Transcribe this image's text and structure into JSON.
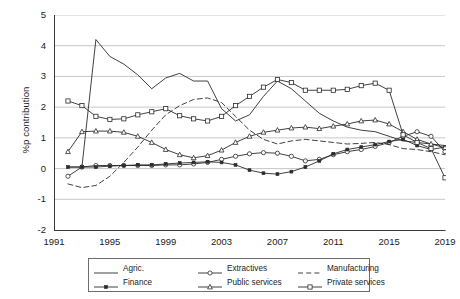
{
  "axes": {
    "ylabel": "%p contribution",
    "yticks": [
      "5",
      "4",
      "3",
      "2",
      "1",
      "0",
      "-1",
      "-2"
    ],
    "ytickvals": [
      5,
      4,
      3,
      2,
      1,
      0,
      -1,
      -2
    ],
    "xticks": [
      "1991",
      "1995",
      "1999",
      "2003",
      "2007",
      "2011",
      "2015",
      "2019"
    ],
    "xtickvals": [
      1991,
      1995,
      1999,
      2003,
      2007,
      2011,
      2015,
      2019
    ]
  },
  "legend": {
    "items": [
      {
        "label": "Agric.",
        "key": "line",
        "marker": "none"
      },
      {
        "label": "Extractives",
        "key": "line-marker",
        "marker": "circle"
      },
      {
        "label": "Manufacturing",
        "key": "dashed",
        "marker": "none"
      },
      {
        "label": "Finance",
        "key": "line-marker",
        "marker": "dot"
      },
      {
        "label": "Public services",
        "key": "line-marker",
        "marker": "triangle"
      },
      {
        "label": "Private services",
        "key": "line-marker",
        "marker": "square"
      }
    ]
  },
  "chart_data": {
    "type": "line",
    "title": "",
    "xlabel": "",
    "ylabel": "%p contribution",
    "xlim": [
      1991,
      2019
    ],
    "ylim": [
      -2,
      5
    ],
    "grid": "horizontal",
    "legend_position": "below",
    "x": [
      1992,
      1993,
      1994,
      1995,
      1996,
      1997,
      1998,
      1999,
      2000,
      2001,
      2002,
      2003,
      2004,
      2005,
      2006,
      2007,
      2008,
      2009,
      2010,
      2011,
      2012,
      2013,
      2014,
      2015,
      2016,
      2017,
      2018,
      2019
    ],
    "series": [
      {
        "name": "Agric.",
        "marker": "none",
        "dash": "solid",
        "values": [
          0.05,
          0.05,
          4.2,
          3.65,
          3.4,
          3.05,
          2.6,
          2.95,
          3.1,
          2.85,
          2.85,
          1.95,
          1.55,
          1.75,
          2.35,
          2.85,
          2.6,
          2.2,
          1.8,
          1.55,
          1.35,
          1.25,
          1.2,
          1.05,
          0.9,
          0.85,
          0.8,
          0.75
        ]
      },
      {
        "name": "Extractives",
        "marker": "circle",
        "dash": "solid",
        "values": [
          -0.25,
          0.05,
          0.1,
          0.1,
          0.1,
          0.1,
          0.1,
          0.12,
          0.12,
          0.15,
          0.2,
          0.3,
          0.4,
          0.48,
          0.52,
          0.5,
          0.4,
          0.25,
          0.3,
          0.45,
          0.55,
          0.62,
          0.72,
          0.85,
          1.05,
          1.2,
          1.05,
          0.55
        ]
      },
      {
        "name": "Manufacturing",
        "marker": "none",
        "dash": "dashed",
        "values": [
          -0.5,
          -0.62,
          -0.55,
          -0.25,
          0.2,
          0.7,
          1.25,
          1.75,
          2.05,
          2.25,
          2.3,
          2.15,
          1.7,
          1.25,
          0.95,
          0.8,
          0.9,
          0.95,
          0.9,
          0.85,
          0.8,
          0.82,
          0.85,
          0.78,
          0.65,
          0.62,
          0.55,
          0.45
        ]
      },
      {
        "name": "Finance",
        "marker": "dot",
        "dash": "solid",
        "values": [
          0.05,
          0.05,
          0.05,
          0.08,
          0.1,
          0.12,
          0.12,
          0.15,
          0.18,
          0.2,
          0.22,
          0.2,
          0.12,
          -0.05,
          -0.15,
          -0.18,
          -0.1,
          0.05,
          0.25,
          0.48,
          0.62,
          0.7,
          0.78,
          0.88,
          0.95,
          0.75,
          0.62,
          0.7
        ]
      },
      {
        "name": "Public services",
        "marker": "triangle",
        "dash": "solid",
        "values": [
          0.55,
          1.2,
          1.22,
          1.22,
          1.18,
          1.05,
          0.85,
          0.62,
          0.45,
          0.35,
          0.42,
          0.6,
          0.85,
          1.05,
          1.18,
          1.25,
          1.32,
          1.35,
          1.3,
          1.38,
          1.45,
          1.55,
          1.58,
          1.45,
          1.2,
          0.95,
          0.8,
          0.68
        ]
      },
      {
        "name": "Private services",
        "marker": "square",
        "dash": "solid",
        "values": [
          2.2,
          2.05,
          1.7,
          1.6,
          1.62,
          1.75,
          1.85,
          1.95,
          1.72,
          1.62,
          1.55,
          1.7,
          2.05,
          2.35,
          2.65,
          2.9,
          2.8,
          2.55,
          2.55,
          2.55,
          2.58,
          2.7,
          2.78,
          2.55,
          1.1,
          0.85,
          0.65,
          -0.3
        ]
      }
    ]
  }
}
